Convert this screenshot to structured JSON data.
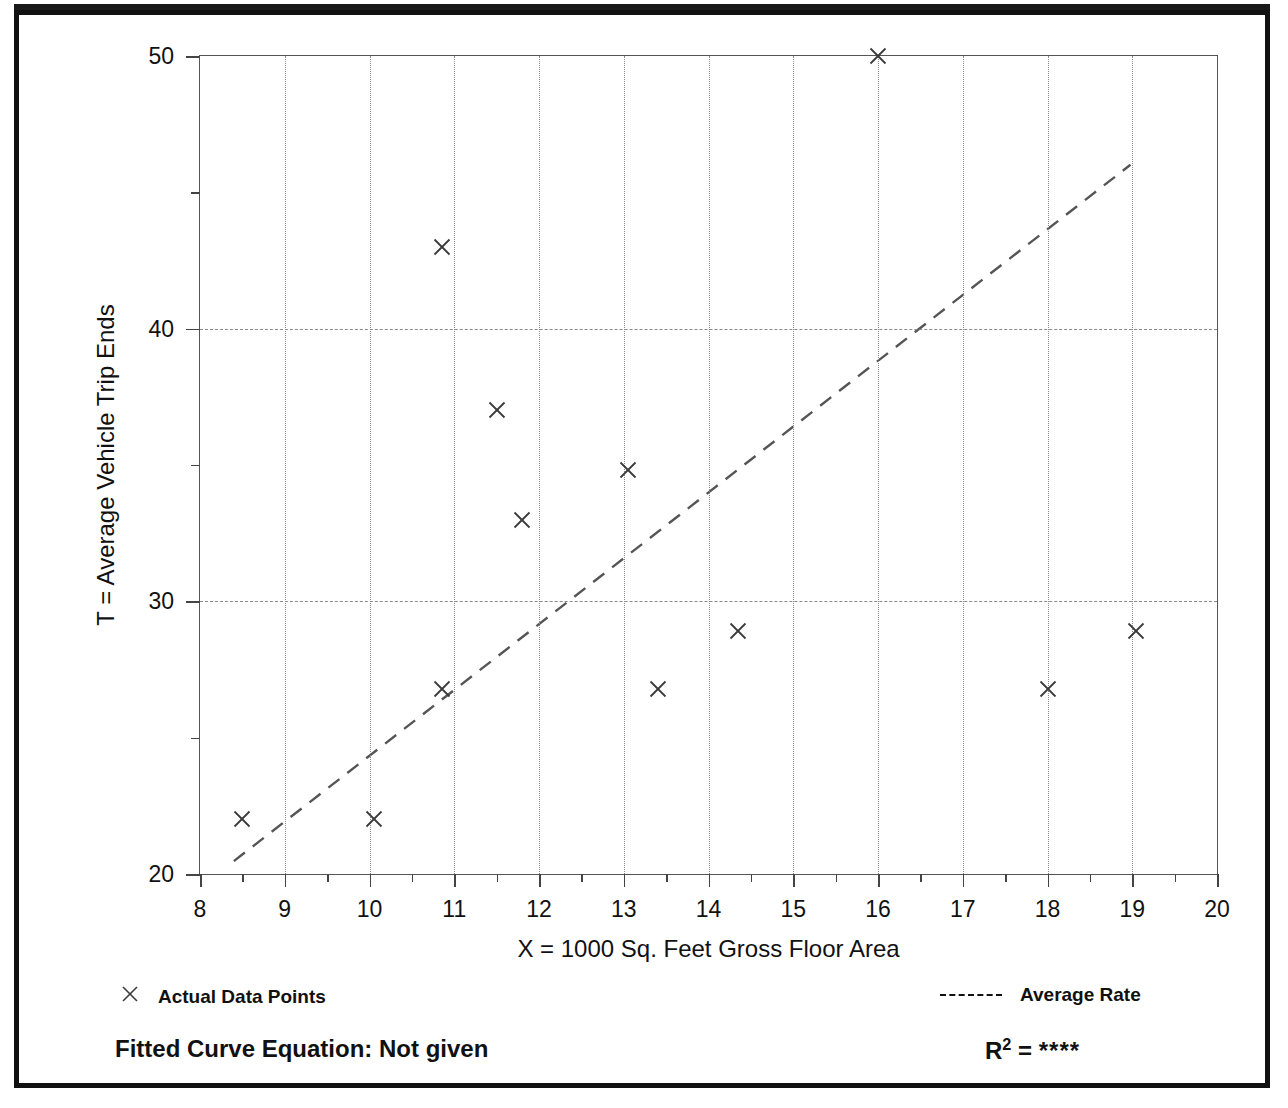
{
  "chart_data": {
    "type": "scatter",
    "title": "",
    "xlabel": "X = 1000 Sq. Feet Gross Floor Area",
    "ylabel": "T = Average Vehicle Trip Ends",
    "xlim": [
      8,
      20
    ],
    "ylim": [
      20,
      50
    ],
    "x_major_ticks": [
      8,
      9,
      10,
      11,
      12,
      13,
      14,
      15,
      16,
      17,
      18,
      19,
      20
    ],
    "x_minor_ticks": [
      8.5,
      9.5,
      10.5,
      11.5,
      12.5,
      13.5,
      14.5,
      15.5,
      16.5,
      17.5,
      18.5,
      19.5
    ],
    "y_major_ticks": [
      20,
      30,
      40,
      50
    ],
    "y_minor_ticks": [
      25,
      35,
      45
    ],
    "x_tick_labels": [
      "8",
      "9",
      "10",
      "11",
      "12",
      "13",
      "14",
      "15",
      "16",
      "17",
      "18",
      "19",
      "20"
    ],
    "y_tick_labels": [
      "20",
      "30",
      "40",
      "50"
    ],
    "grid": {
      "vertical_at": [
        9,
        10,
        11,
        12,
        13,
        14,
        15,
        16,
        17,
        18,
        19
      ],
      "horizontal_at": [
        30,
        40
      ],
      "style": "dotted"
    },
    "legend_position": "below-plot",
    "series": [
      {
        "name": "Actual Data Points",
        "type": "scatter",
        "marker": "x",
        "points": [
          {
            "x": 8.5,
            "y": 22.0
          },
          {
            "x": 10.05,
            "y": 22.0
          },
          {
            "x": 10.85,
            "y": 26.8
          },
          {
            "x": 10.85,
            "y": 43.0
          },
          {
            "x": 11.5,
            "y": 37.0
          },
          {
            "x": 11.8,
            "y": 33.0
          },
          {
            "x": 13.05,
            "y": 34.8
          },
          {
            "x": 13.4,
            "y": 26.8
          },
          {
            "x": 14.35,
            "y": 28.9
          },
          {
            "x": 16.0,
            "y": 50.0
          },
          {
            "x": 18.0,
            "y": 26.8
          },
          {
            "x": 19.05,
            "y": 28.9
          }
        ]
      },
      {
        "name": "Average Rate",
        "type": "line",
        "style": "dashed",
        "points": [
          {
            "x": 8.4,
            "y": 20.4
          },
          {
            "x": 19.0,
            "y": 46.0
          }
        ]
      }
    ]
  },
  "axes": {
    "x_title": "X = 1000 Sq. Feet Gross Floor Area",
    "y_title": "T = Average Vehicle Trip Ends"
  },
  "legend": {
    "actual_points_label": "Actual Data Points",
    "average_rate_label": "Average Rate",
    "marker_glyph": "×"
  },
  "footer": {
    "fitted_equation_label": "Fitted Curve Equation:  Not given",
    "r_squared_prefix": "R",
    "r_squared_exponent": "2",
    "r_squared_equals": " = ",
    "r_squared_value": "****"
  },
  "colors": {
    "frame": "#111111",
    "axis": "#555555",
    "grid": "#8a8a8a",
    "marker": "#3a3a3a",
    "trendline": "#555555",
    "text": "#111111",
    "background": "#ffffff"
  }
}
